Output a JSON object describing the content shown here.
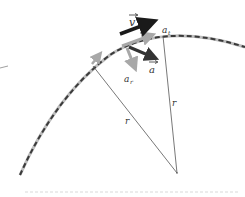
{
  "diagram": {
    "labels": {
      "velocity": "v",
      "acceleration": "a",
      "tangential": "a",
      "tangential_sub": "t",
      "radial": "a",
      "radial_sub": "r",
      "radius_1": "r",
      "radius_2": "r"
    },
    "colors": {
      "path_dark": "#3a3a3a",
      "path_light": "#bdbdbd",
      "vector_dark": "#1a1a1a",
      "accel_dark": "#333333",
      "component_gray": "#a8a8a8",
      "radius_line": "#555555"
    }
  }
}
